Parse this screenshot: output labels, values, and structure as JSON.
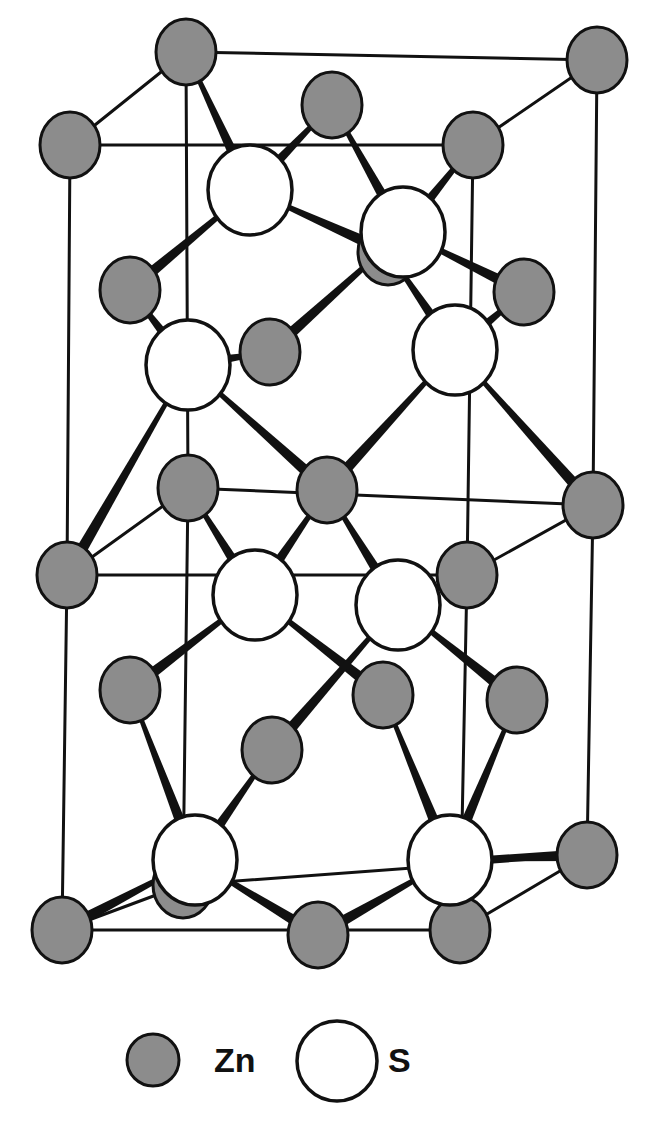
{
  "title": "",
  "structure": "Zinc blende (ZnS) crystal structure",
  "colors": {
    "zn_fill": "#8c8c8c",
    "s_fill": "#ffffff",
    "line": "#111111",
    "background": "#ffffff"
  },
  "legend": {
    "items": [
      {
        "key": "zn",
        "label": "Zn",
        "symbol": "filled-gray-circle"
      },
      {
        "key": "s",
        "label": "S",
        "symbol": "open-white-circle"
      }
    ]
  },
  "cell_edges": [
    [
      186,
      52,
      597,
      60
    ],
    [
      70,
      145,
      473,
      145
    ],
    [
      70,
      145,
      186,
      52
    ],
    [
      473,
      145,
      597,
      60
    ],
    [
      70,
      145,
      67,
      575
    ],
    [
      473,
      145,
      467,
      575
    ],
    [
      597,
      60,
      593,
      505
    ],
    [
      186,
      52,
      188,
      488
    ],
    [
      67,
      575,
      467,
      575
    ],
    [
      188,
      488,
      593,
      505
    ],
    [
      67,
      575,
      188,
      488
    ],
    [
      467,
      575,
      593,
      505
    ],
    [
      67,
      575,
      62,
      930
    ],
    [
      467,
      575,
      460,
      930
    ],
    [
      593,
      505,
      587,
      855
    ],
    [
      188,
      488,
      183,
      885
    ],
    [
      62,
      930,
      460,
      930
    ],
    [
      183,
      885,
      587,
      855
    ],
    [
      62,
      930,
      183,
      885
    ],
    [
      460,
      930,
      587,
      855
    ]
  ],
  "bonds": [
    [
      186,
      52,
      250,
      190
    ],
    [
      332,
      105,
      250,
      190
    ],
    [
      250,
      190,
      130,
      290
    ],
    [
      250,
      190,
      388,
      252
    ],
    [
      332,
      105,
      403,
      232
    ],
    [
      473,
      145,
      403,
      232
    ],
    [
      403,
      232,
      270,
      352
    ],
    [
      403,
      232,
      524,
      292
    ],
    [
      130,
      290,
      188,
      365
    ],
    [
      270,
      352,
      188,
      365
    ],
    [
      188,
      365,
      67,
      575
    ],
    [
      188,
      365,
      327,
      490
    ],
    [
      388,
      252,
      455,
      350
    ],
    [
      524,
      292,
      455,
      350
    ],
    [
      455,
      350,
      327,
      490
    ],
    [
      455,
      350,
      593,
      505
    ],
    [
      188,
      488,
      255,
      595
    ],
    [
      327,
      490,
      255,
      595
    ],
    [
      255,
      595,
      130,
      690
    ],
    [
      255,
      595,
      383,
      695
    ],
    [
      327,
      490,
      398,
      605
    ],
    [
      467,
      575,
      398,
      605
    ],
    [
      398,
      605,
      272,
      750
    ],
    [
      398,
      605,
      517,
      700
    ],
    [
      130,
      690,
      195,
      860
    ],
    [
      272,
      750,
      195,
      860
    ],
    [
      195,
      860,
      62,
      930
    ],
    [
      195,
      860,
      318,
      935
    ],
    [
      383,
      695,
      450,
      860
    ],
    [
      517,
      700,
      450,
      860
    ],
    [
      450,
      860,
      318,
      935
    ],
    [
      450,
      860,
      587,
      855
    ]
  ],
  "zn_atoms": [
    [
      186,
      52
    ],
    [
      597,
      60
    ],
    [
      332,
      105
    ],
    [
      70,
      145
    ],
    [
      473,
      145
    ],
    [
      130,
      290
    ],
    [
      388,
      252
    ],
    [
      524,
      292
    ],
    [
      270,
      352
    ],
    [
      188,
      488
    ],
    [
      593,
      505
    ],
    [
      327,
      490
    ],
    [
      67,
      575
    ],
    [
      467,
      575
    ],
    [
      130,
      690
    ],
    [
      383,
      695
    ],
    [
      517,
      700
    ],
    [
      272,
      750
    ],
    [
      183,
      885
    ],
    [
      587,
      855
    ],
    [
      318,
      935
    ],
    [
      62,
      930
    ],
    [
      460,
      930
    ]
  ],
  "s_atoms": [
    [
      250,
      190
    ],
    [
      403,
      232
    ],
    [
      188,
      365
    ],
    [
      455,
      350
    ],
    [
      255,
      595
    ],
    [
      398,
      605
    ],
    [
      195,
      860
    ],
    [
      450,
      860
    ]
  ],
  "atom_radius": {
    "zn": 30,
    "s": 42
  },
  "counts": {
    "zn_visible": 23,
    "s_visible": 8
  }
}
